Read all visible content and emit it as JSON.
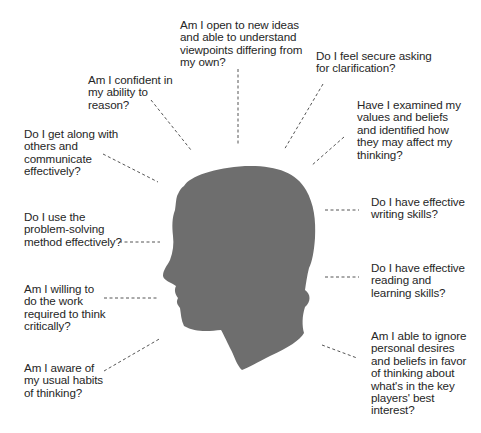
{
  "diagram": {
    "type": "critical-thinking-self-assessment",
    "center_figure": "head-silhouette-profile-facing-left",
    "colors": {
      "silhouette": "#6e6e6e",
      "text": "#262626",
      "connector": "#555555",
      "background": "#ffffff"
    },
    "questions": [
      {
        "id": "open-ideas",
        "text": "Am I open to new ideas\nand able to understand\nviewpoints differing from\nmy own?"
      },
      {
        "id": "confident-reason",
        "text": "Am I confident in\nmy ability to\nreason?"
      },
      {
        "id": "secure-clarification",
        "text": "Do I feel secure asking\nfor clarification?"
      },
      {
        "id": "get-along",
        "text": "Do I get along with\nothers and\ncommunicate\neffectively?"
      },
      {
        "id": "examined-values",
        "text": "Have I examined my\nvalues and beliefs\nand identified how\nthey may affect my\nthinking?"
      },
      {
        "id": "problem-solving",
        "text": "Do I use the\nproblem-solving\nmethod effectively?"
      },
      {
        "id": "writing-skills",
        "text": "Do I have effective\nwriting skills?"
      },
      {
        "id": "willing-work",
        "text": "Am I willing to\ndo the work\nrequired to think\ncritically?"
      },
      {
        "id": "reading-skills",
        "text": "Do I have effective\nreading and\nlearning skills?"
      },
      {
        "id": "aware-habits",
        "text": "Am I aware of\nmy usual habits\nof thinking?"
      },
      {
        "id": "ignore-desires",
        "text": "Am I able to ignore\npersonal desires\nand beliefs in favor\nof thinking about\nwhat's in the key\nplayers' best\ninterest?"
      }
    ]
  }
}
